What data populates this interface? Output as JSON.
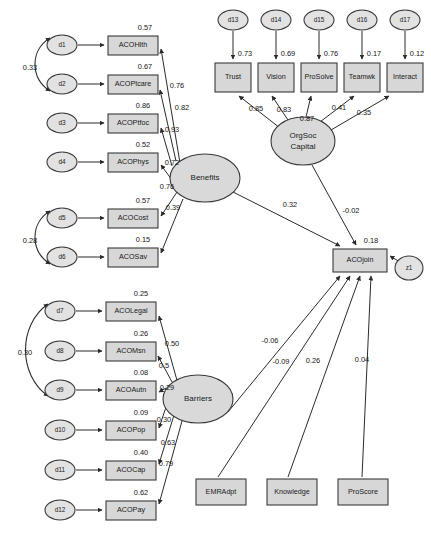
{
  "diagram": {
    "type": "sem-path-diagram",
    "colors": {
      "node_fill": "#d7d7d7",
      "ellipse_fill": "#d9d9d9",
      "error_fill": "#e2e2e2",
      "stroke": "#3a3a3a",
      "text": "#1a1a1a"
    }
  },
  "latent_variables": [
    {
      "id": "benefits",
      "label": "Benefits",
      "cx": 205,
      "cy": 178,
      "rx": 35,
      "ry": 24
    },
    {
      "id": "barriers",
      "label": "Barriers",
      "cx": 198,
      "cy": 399,
      "rx": 35,
      "ry": 24
    },
    {
      "id": "orgsoc",
      "label": "OrgSoc Capital",
      "label_line1": "OrgSoc",
      "label_line2": "Capital",
      "cx": 303,
      "cy": 141,
      "rx": 32,
      "ry": 24
    }
  ],
  "observed_boxes": [
    {
      "id": "acohlth",
      "label": "ACOHlth",
      "x": 108,
      "y": 36,
      "w": 50,
      "h": 19,
      "r2": "0.57"
    },
    {
      "id": "acoptcare",
      "label": "ACOPtcare",
      "x": 108,
      "y": 75,
      "w": 50,
      "h": 19,
      "r2": "0.67"
    },
    {
      "id": "acoptfoc",
      "label": "ACOPtfoc",
      "x": 108,
      "y": 114,
      "w": 50,
      "h": 19,
      "r2": "0.86"
    },
    {
      "id": "acophys",
      "label": "ACOPhys",
      "x": 108,
      "y": 153,
      "w": 50,
      "h": 19,
      "r2": "0.52"
    },
    {
      "id": "acocost",
      "label": "ACOCost",
      "x": 108,
      "y": 209,
      "w": 50,
      "h": 19,
      "r2": "0.57"
    },
    {
      "id": "acosav",
      "label": "ACOSav",
      "x": 108,
      "y": 248,
      "w": 50,
      "h": 19,
      "r2": "0.15"
    },
    {
      "id": "acolegal",
      "label": "ACOLegal",
      "x": 106,
      "y": 302,
      "w": 50,
      "h": 19,
      "r2": "0.25"
    },
    {
      "id": "acomsn",
      "label": "ACOMsn",
      "x": 106,
      "y": 342,
      "w": 50,
      "h": 19,
      "r2": "0.26"
    },
    {
      "id": "acoautn",
      "label": "ACOAutn",
      "x": 106,
      "y": 381,
      "w": 50,
      "h": 19,
      "r2": "0.08"
    },
    {
      "id": "acopop",
      "label": "ACOPop",
      "x": 106,
      "y": 421,
      "w": 50,
      "h": 19,
      "r2": "0.09"
    },
    {
      "id": "acocap",
      "label": "ACOCap",
      "x": 106,
      "y": 461,
      "w": 50,
      "h": 19,
      "r2": "0.40"
    },
    {
      "id": "acopay",
      "label": "ACOPay",
      "x": 106,
      "y": 501,
      "w": 50,
      "h": 19,
      "r2": "0.62"
    },
    {
      "id": "trust",
      "label": "Trust",
      "x": 215,
      "y": 63,
      "w": 36,
      "h": 29,
      "r2": "0.73"
    },
    {
      "id": "vision",
      "label": "Vision",
      "x": 258,
      "y": 63,
      "w": 36,
      "h": 29,
      "r2": "0.69"
    },
    {
      "id": "prosolve",
      "label": "ProSolve",
      "x": 301,
      "y": 63,
      "w": 36,
      "h": 29,
      "r2": "0.76"
    },
    {
      "id": "teamwk",
      "label": "Teamwk",
      "x": 344,
      "y": 63,
      "w": 36,
      "h": 29,
      "r2": "0.17"
    },
    {
      "id": "interact",
      "label": "Interact",
      "x": 387,
      "y": 63,
      "w": 36,
      "h": 29,
      "r2": "0.12"
    },
    {
      "id": "acojoin",
      "label": "ACOjoin",
      "x": 333,
      "y": 249,
      "w": 54,
      "h": 23,
      "r2": "0.18"
    },
    {
      "id": "emradpt",
      "label": "EMRAdpt",
      "x": 196,
      "y": 479,
      "w": 50,
      "h": 26,
      "r2": ""
    },
    {
      "id": "knowledge",
      "label": "Knowledge",
      "x": 267,
      "y": 479,
      "w": 50,
      "h": 26,
      "r2": ""
    },
    {
      "id": "proscore",
      "label": "ProScore",
      "x": 338,
      "y": 479,
      "w": 50,
      "h": 26,
      "r2": ""
    }
  ],
  "error_terms": [
    {
      "id": "d1",
      "label": "d1",
      "cx": 62,
      "cy": 45,
      "rx": 15,
      "ry": 10
    },
    {
      "id": "d2",
      "label": "d2",
      "cx": 62,
      "cy": 84,
      "rx": 15,
      "ry": 10
    },
    {
      "id": "d3",
      "label": "d3",
      "cx": 62,
      "cy": 123,
      "rx": 15,
      "ry": 10
    },
    {
      "id": "d4",
      "label": "d4",
      "cx": 62,
      "cy": 162,
      "rx": 15,
      "ry": 10
    },
    {
      "id": "d5",
      "label": "d5",
      "cx": 62,
      "cy": 218,
      "rx": 15,
      "ry": 10
    },
    {
      "id": "d6",
      "label": "d6",
      "cx": 62,
      "cy": 257,
      "rx": 15,
      "ry": 10
    },
    {
      "id": "d7",
      "label": "d7",
      "cx": 60,
      "cy": 311,
      "rx": 15,
      "ry": 10
    },
    {
      "id": "d8",
      "label": "d8",
      "cx": 60,
      "cy": 351,
      "rx": 15,
      "ry": 10
    },
    {
      "id": "d9",
      "label": "d9",
      "cx": 60,
      "cy": 390,
      "rx": 15,
      "ry": 10
    },
    {
      "id": "d10",
      "label": "d10",
      "cx": 60,
      "cy": 430,
      "rx": 15,
      "ry": 10
    },
    {
      "id": "d11",
      "label": "d11",
      "cx": 60,
      "cy": 470,
      "rx": 15,
      "ry": 10
    },
    {
      "id": "d12",
      "label": "d12",
      "cx": 60,
      "cy": 510,
      "rx": 15,
      "ry": 10
    },
    {
      "id": "d13",
      "label": "d13",
      "cx": 233,
      "cy": 20,
      "rx": 15,
      "ry": 10
    },
    {
      "id": "d14",
      "label": "d14",
      "cx": 276,
      "cy": 20,
      "rx": 15,
      "ry": 10
    },
    {
      "id": "d15",
      "label": "d15",
      "cx": 319,
      "cy": 20,
      "rx": 15,
      "ry": 10
    },
    {
      "id": "d16",
      "label": "d16",
      "cx": 362,
      "cy": 20,
      "rx": 15,
      "ry": 10
    },
    {
      "id": "d17",
      "label": "d17",
      "cx": 405,
      "cy": 20,
      "rx": 15,
      "ry": 10
    },
    {
      "id": "z1",
      "label": "z1",
      "cx": 409,
      "cy": 268,
      "rx": 14,
      "ry": 12
    }
  ],
  "loadings": {
    "benefits": [
      {
        "target": "ACOHlth",
        "value": "0.76"
      },
      {
        "target": "ACOPtcare",
        "value": "0.82"
      },
      {
        "target": "ACOPtfoc",
        "value": "0.93"
      },
      {
        "target": "ACOPhys",
        "value": "0.72"
      },
      {
        "target": "ACOCost",
        "value": "0.76"
      },
      {
        "target": "ACOSav",
        "value": "0.39"
      }
    ],
    "barriers": [
      {
        "target": "ACOLegal",
        "value": "0.50"
      },
      {
        "target": "ACOMsn",
        "value": "0.5"
      },
      {
        "target": "ACOAutn",
        "value": "0.29"
      },
      {
        "target": "ACOPop",
        "value": "0.30"
      },
      {
        "target": "ACOCap",
        "value": "0.63"
      },
      {
        "target": "ACOPay",
        "value": "0.79"
      }
    ],
    "orgsoc": [
      {
        "target": "Trust",
        "value": "0.85"
      },
      {
        "target": "Vision",
        "value": "0.83"
      },
      {
        "target": "ProSolve",
        "value": "0.87"
      },
      {
        "target": "Teamwk",
        "value": "0.41"
      },
      {
        "target": "Interact",
        "value": "0.35"
      }
    ]
  },
  "structural_paths": [
    {
      "from": "Benefits",
      "to": "ACOjoin",
      "value": "0.32"
    },
    {
      "from": "OrgSoc Capital",
      "to": "ACOjoin",
      "value": "-0.02"
    },
    {
      "from": "Barriers",
      "to": "ACOjoin",
      "value": "-0.06"
    },
    {
      "from": "EMRAdpt",
      "to": "ACOjoin",
      "value": "-0.09"
    },
    {
      "from": "Knowledge",
      "to": "ACOjoin",
      "value": "0.26"
    },
    {
      "from": "ProScore",
      "to": "ACOjoin",
      "value": "0.04"
    }
  ],
  "correlations": [
    {
      "between": [
        "d1",
        "d2"
      ],
      "value": "0.33",
      "label_x": 30,
      "label_y": 68
    },
    {
      "between": [
        "d5",
        "d6"
      ],
      "value": "0.28",
      "label_x": 30,
      "label_y": 241
    },
    {
      "between": [
        "d7",
        "d9"
      ],
      "value": "0.30",
      "label_x": 25,
      "label_y": 353
    }
  ],
  "coefficient_labels": [
    {
      "id": "l-hlth",
      "value": "0.76",
      "x": 177,
      "y": 86
    },
    {
      "id": "l-ptcare",
      "value": "0.82",
      "x": 182,
      "y": 108
    },
    {
      "id": "l-ptfoc",
      "value": "0.93",
      "x": 172,
      "y": 130
    },
    {
      "id": "l-phys",
      "value": "0.72",
      "x": 172,
      "y": 163
    },
    {
      "id": "l-cost",
      "value": "0.76",
      "x": 167,
      "y": 187
    },
    {
      "id": "l-sav",
      "value": "0.39",
      "x": 173,
      "y": 208
    },
    {
      "id": "l-legal",
      "value": "0.50",
      "x": 172,
      "y": 344
    },
    {
      "id": "l-msn",
      "value": "0.5",
      "x": 164,
      "y": 366
    },
    {
      "id": "l-autn",
      "value": "0.29",
      "x": 167,
      "y": 388
    },
    {
      "id": "l-pop",
      "value": "0.30",
      "x": 164,
      "y": 420
    },
    {
      "id": "l-cap",
      "value": "0.63",
      "x": 168,
      "y": 443
    },
    {
      "id": "l-pay",
      "value": "0.79",
      "x": 166,
      "y": 464
    },
    {
      "id": "l-trust",
      "value": "0.85",
      "x": 256,
      "y": 109
    },
    {
      "id": "l-vision",
      "value": "0.83",
      "x": 284,
      "y": 110
    },
    {
      "id": "l-prosolve",
      "value": "0.87",
      "x": 307,
      "y": 119
    },
    {
      "id": "l-teamwk",
      "value": "0.41",
      "x": 339,
      "y": 108
    },
    {
      "id": "l-interact",
      "value": "0.35",
      "x": 364,
      "y": 113
    },
    {
      "id": "p-benefits",
      "value": "0.32",
      "x": 290,
      "y": 205
    },
    {
      "id": "p-orgsoc",
      "value": "-0.02",
      "x": 351,
      "y": 211
    },
    {
      "id": "p-barriers",
      "value": "-0.06",
      "x": 270,
      "y": 341
    },
    {
      "id": "p-emradpt",
      "value": "-0.09",
      "x": 281,
      "y": 362
    },
    {
      "id": "p-knowledge",
      "value": "0.26",
      "x": 313,
      "y": 361
    },
    {
      "id": "p-proscore",
      "value": "0.04",
      "x": 362,
      "y": 360
    }
  ],
  "r2_labels": [
    {
      "id": "r2-hlth",
      "value": "0.57",
      "x": 145,
      "y": 28
    },
    {
      "id": "r2-ptcare",
      "value": "0.67",
      "x": 145,
      "y": 67
    },
    {
      "id": "r2-ptfoc",
      "value": "0.86",
      "x": 143,
      "y": 106
    },
    {
      "id": "r2-phys",
      "value": "0.52",
      "x": 143,
      "y": 145
    },
    {
      "id": "r2-cost",
      "value": "0.57",
      "x": 143,
      "y": 201
    },
    {
      "id": "r2-sav",
      "value": "0.15",
      "x": 143,
      "y": 240
    },
    {
      "id": "r2-legal",
      "value": "0.25",
      "x": 141,
      "y": 294
    },
    {
      "id": "r2-msn",
      "value": "0.26",
      "x": 141,
      "y": 334
    },
    {
      "id": "r2-autn",
      "value": "0.08",
      "x": 141,
      "y": 373
    },
    {
      "id": "r2-pop",
      "value": "0.09",
      "x": 141,
      "y": 413
    },
    {
      "id": "r2-cap",
      "value": "0.40",
      "x": 141,
      "y": 453
    },
    {
      "id": "r2-pay",
      "value": "0.62",
      "x": 141,
      "y": 493
    },
    {
      "id": "r2-trust",
      "value": "0.73",
      "x": 245,
      "y": 54
    },
    {
      "id": "r2-vision",
      "value": "0.69",
      "x": 288,
      "y": 54
    },
    {
      "id": "r2-prosolve",
      "value": "0.76",
      "x": 331,
      "y": 54
    },
    {
      "id": "r2-teamwk",
      "value": "0.17",
      "x": 374,
      "y": 54
    },
    {
      "id": "r2-interact",
      "value": "0.12",
      "x": 417,
      "y": 54
    },
    {
      "id": "r2-acojoin",
      "value": "0.18",
      "x": 371,
      "y": 241
    }
  ]
}
